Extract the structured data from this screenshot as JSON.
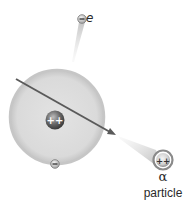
{
  "diagram": {
    "labels": {
      "electron_ejected": "e",
      "alpha_symbol": "α",
      "alpha_word": "particle"
    },
    "charges": {
      "nucleus": "++",
      "alpha": "++",
      "electron": "−"
    },
    "colors": {
      "background": "#ffffff",
      "electron_cloud": "#d6d6d6",
      "electron_cloud_edge": "#bdbdbd",
      "nucleus": "#6b6b6b",
      "trajectory": "#555555",
      "cone": "#c8c8c8"
    }
  }
}
